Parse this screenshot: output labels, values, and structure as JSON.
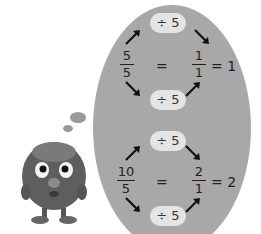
{
  "colors": {
    "oval_fill": "#a8a8a8",
    "pill_fill": "#e4e4e4",
    "text": "#222222",
    "background": "#ffffff"
  },
  "top": {
    "divide_top": "÷ 5",
    "divide_bottom": "÷ 5",
    "left_numerator": "5",
    "left_denominator": "5",
    "equals": "=",
    "right_numerator": "1",
    "right_denominator": "1",
    "result": "= 1"
  },
  "bottom": {
    "divide_top": "÷ 5",
    "divide_bottom": "÷ 5",
    "left_numerator": "10",
    "left_denominator": "5",
    "equals": "=",
    "right_numerator": "2",
    "right_denominator": "1",
    "result": "= 2"
  },
  "character": {
    "icon": "furry-monster-thinking"
  }
}
